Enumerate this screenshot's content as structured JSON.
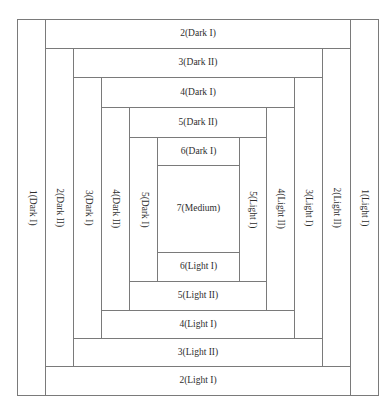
{
  "diagram": {
    "line_color": "#7a7a7a",
    "text_color": "#2e2e2e",
    "pieces": [
      {
        "id": "left-1",
        "label": "1(Dark I)",
        "orientation": "vertical",
        "x": 17,
        "y": 19,
        "w": 29,
        "h": 377
      },
      {
        "id": "top-2",
        "label": "2(Dark I)",
        "orientation": "horizontal",
        "x": 45,
        "y": 19,
        "w": 306,
        "h": 30
      },
      {
        "id": "right-1",
        "label": "1(Light I)",
        "orientation": "vertical",
        "x": 350,
        "y": 19,
        "w": 29,
        "h": 377
      },
      {
        "id": "left-2",
        "label": "2(Dark II)",
        "orientation": "vertical",
        "x": 45,
        "y": 48,
        "w": 29,
        "h": 319
      },
      {
        "id": "top-3",
        "label": "3(Dark II)",
        "orientation": "horizontal",
        "x": 73,
        "y": 48,
        "w": 250,
        "h": 30
      },
      {
        "id": "right-2",
        "label": "2(Light II)",
        "orientation": "vertical",
        "x": 322,
        "y": 48,
        "w": 29,
        "h": 319
      },
      {
        "id": "left-3",
        "label": "3(Dark I)",
        "orientation": "vertical",
        "x": 73,
        "y": 77,
        "w": 29,
        "h": 262
      },
      {
        "id": "top-4",
        "label": "4(Dark I)",
        "orientation": "horizontal",
        "x": 101,
        "y": 77,
        "w": 194,
        "h": 31
      },
      {
        "id": "right-3",
        "label": "3(Light I)",
        "orientation": "vertical",
        "x": 294,
        "y": 77,
        "w": 29,
        "h": 262
      },
      {
        "id": "left-4",
        "label": "4(Dark II)",
        "orientation": "vertical",
        "x": 101,
        "y": 107,
        "w": 29,
        "h": 204
      },
      {
        "id": "top-5",
        "label": "5(Dark II)",
        "orientation": "horizontal",
        "x": 129,
        "y": 107,
        "w": 138,
        "h": 31
      },
      {
        "id": "right-4",
        "label": "4(Light II)",
        "orientation": "vertical",
        "x": 266,
        "y": 107,
        "w": 29,
        "h": 204
      },
      {
        "id": "left-5",
        "label": "5(Dark I)",
        "orientation": "vertical",
        "x": 129,
        "y": 137,
        "w": 29,
        "h": 145
      },
      {
        "id": "top-6",
        "label": "6(Dark I)",
        "orientation": "horizontal",
        "x": 157,
        "y": 137,
        "w": 83,
        "h": 29
      },
      {
        "id": "right-5",
        "label": "5(Light I)",
        "orientation": "vertical",
        "x": 239,
        "y": 137,
        "w": 28,
        "h": 145
      },
      {
        "id": "center-7",
        "label": "7(Medium)",
        "orientation": "horizontal",
        "x": 157,
        "y": 165,
        "w": 83,
        "h": 88
      },
      {
        "id": "bottom-6",
        "label": "6(Light I)",
        "orientation": "horizontal",
        "x": 157,
        "y": 252,
        "w": 83,
        "h": 30
      },
      {
        "id": "bottom-5",
        "label": "5(Light II)",
        "orientation": "horizontal",
        "x": 129,
        "y": 281,
        "w": 138,
        "h": 30
      },
      {
        "id": "bottom-4",
        "label": "4(Light I)",
        "orientation": "horizontal",
        "x": 101,
        "y": 310,
        "w": 194,
        "h": 29
      },
      {
        "id": "bottom-3",
        "label": "3(Light II)",
        "orientation": "horizontal",
        "x": 73,
        "y": 338,
        "w": 250,
        "h": 29
      },
      {
        "id": "bottom-2",
        "label": "2(Light I)",
        "orientation": "horizontal",
        "x": 45,
        "y": 366,
        "w": 306,
        "h": 30
      }
    ]
  }
}
